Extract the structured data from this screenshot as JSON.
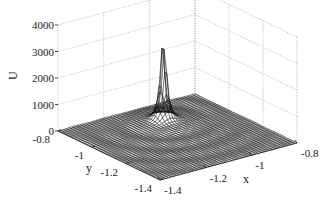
{
  "chart_data": {
    "type": "surface3d",
    "title": "",
    "xlabel": "x",
    "ylabel": "y",
    "zlabel": "U",
    "xlim": [
      -1.4,
      -0.8
    ],
    "ylim": [
      -1.4,
      -0.8
    ],
    "zlim": [
      0,
      4000
    ],
    "x_ticks": [
      "-1.4",
      "-1.2",
      "-1",
      "-0.8"
    ],
    "y_ticks": [
      "-0.8",
      "-1",
      "-1.2",
      "-1.4"
    ],
    "z_ticks": [
      "0",
      "1000",
      "2000",
      "3000",
      "4000"
    ],
    "grid": true,
    "colormap": "grayscale mesh",
    "peak": {
      "x": -1.05,
      "y": -0.95,
      "z": 3500
    },
    "base_level": 0
  },
  "labels": {
    "x": "x",
    "y": "y",
    "z": "U"
  }
}
